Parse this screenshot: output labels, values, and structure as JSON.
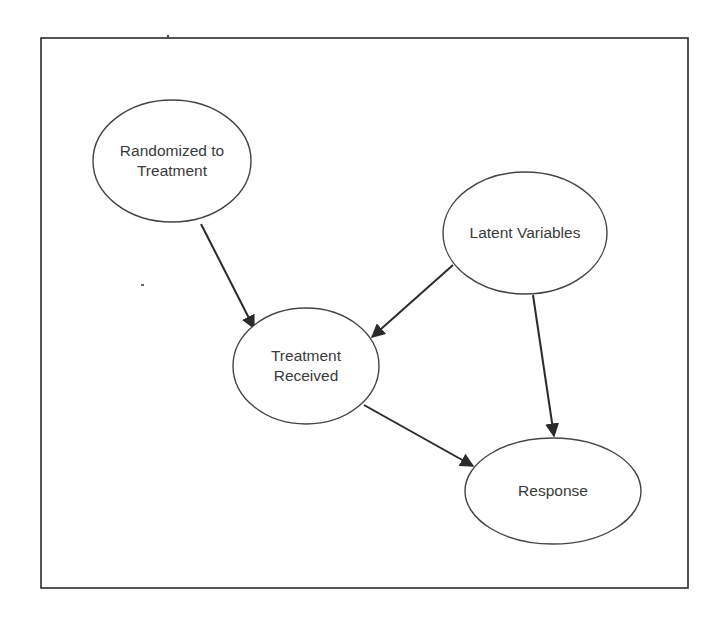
{
  "diagram": {
    "type": "causal-graph",
    "frame": {
      "x": 41,
      "y": 38,
      "width": 647,
      "height": 550,
      "stroke": "#2b2b2b"
    },
    "colors": {
      "node_fill": "#ffffff",
      "node_stroke": "#444444",
      "edge_stroke": "#2a2a2a",
      "text": "#3a3a3a"
    },
    "nodes": [
      {
        "id": "randomized",
        "label": "Randomized to\nTreatment",
        "cx": 172,
        "cy": 161,
        "rx": 79,
        "ry": 61
      },
      {
        "id": "latent",
        "label": "Latent Variables",
        "cx": 525,
        "cy": 233,
        "rx": 82,
        "ry": 61
      },
      {
        "id": "treatment_received",
        "label": "Treatment\nReceived",
        "cx": 306,
        "cy": 366,
        "rx": 73,
        "ry": 58
      },
      {
        "id": "response",
        "label": "Response",
        "cx": 553,
        "cy": 491,
        "rx": 88,
        "ry": 53
      }
    ],
    "edges": [
      {
        "from": "randomized",
        "to": "treatment_received",
        "x1": 201,
        "y1": 224,
        "x2": 254,
        "y2": 328
      },
      {
        "from": "latent",
        "to": "treatment_received",
        "x1": 453,
        "y1": 265,
        "x2": 372,
        "y2": 337
      },
      {
        "from": "latent",
        "to": "response",
        "x1": 533,
        "y1": 295,
        "x2": 554,
        "y2": 436
      },
      {
        "from": "treatment_received",
        "to": "response",
        "x1": 364,
        "y1": 405,
        "x2": 473,
        "y2": 466
      }
    ]
  }
}
